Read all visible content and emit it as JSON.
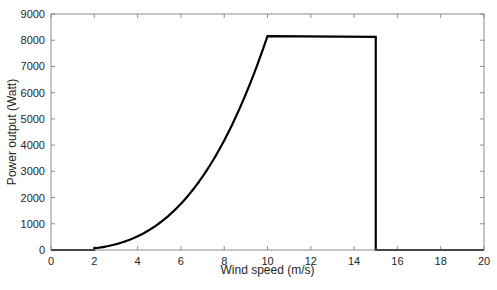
{
  "chart_data": {
    "type": "line",
    "title": "",
    "xlabel": "Wind speed (m/s)",
    "ylabel": "Power output (Watt)",
    "xlim": [
      0,
      20
    ],
    "ylim": [
      0,
      9000
    ],
    "xticks": [
      0,
      2,
      4,
      6,
      8,
      10,
      12,
      14,
      16,
      18,
      20
    ],
    "yticks": [
      0,
      1000,
      2000,
      3000,
      4000,
      5000,
      6000,
      7000,
      8000,
      9000
    ],
    "grid": false,
    "legend": null,
    "series": [
      {
        "name": "Power curve",
        "color": "#000000",
        "x": [
          0,
          2,
          2,
          3,
          4,
          5,
          6,
          7,
          8,
          9,
          10,
          15,
          15,
          20
        ],
        "y": [
          0,
          0,
          65,
          220,
          522,
          1020,
          1763,
          2799,
          4178,
          5949,
          8160,
          8130,
          0,
          0
        ]
      }
    ]
  }
}
